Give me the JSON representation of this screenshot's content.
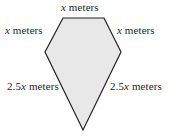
{
  "figure": {
    "kind": "geometry-diagram",
    "shape_name": "pentagon-kite",
    "fill_color": "#e8e8e8",
    "stroke_color": "#231f20",
    "background_color": "#ffffff",
    "stroke_width": 1.2,
    "vertices": [
      {
        "name": "top-left",
        "x": 63,
        "y": 18
      },
      {
        "name": "top-right",
        "x": 104,
        "y": 18
      },
      {
        "name": "right",
        "x": 121,
        "y": 52
      },
      {
        "name": "bottom-apex",
        "x": 83,
        "y": 130
      },
      {
        "name": "left",
        "x": 45,
        "y": 52
      }
    ]
  },
  "labels": {
    "top": {
      "value": "x",
      "unit": "meters"
    },
    "upper_left": {
      "value": "x",
      "unit": "meters"
    },
    "upper_right": {
      "value": "x",
      "unit": "meters"
    },
    "lower_left": {
      "value": "2.5x",
      "unit": "meters"
    },
    "lower_right": {
      "value": "2.5x",
      "unit": "meters"
    }
  },
  "label_text": {
    "top_var": "x",
    "top_unit": " meters",
    "upper_left_var": "x",
    "upper_left_unit": " meters",
    "upper_right_var": "x",
    "upper_right_unit": " meters",
    "lower_left_prefix": "2.5",
    "lower_left_var": "x",
    "lower_left_unit": " meters",
    "lower_right_prefix": "2.5",
    "lower_right_var": "x",
    "lower_right_unit": " meters"
  }
}
